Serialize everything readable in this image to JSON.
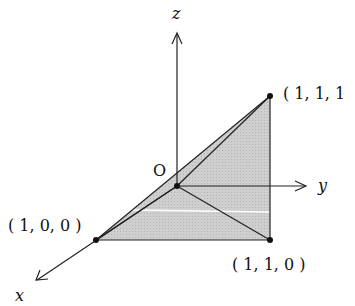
{
  "diagram": {
    "type": "3d-coordinate-triangle",
    "axes": {
      "x_label": "x",
      "y_label": "y",
      "z_label": "z"
    },
    "origin_label": "O",
    "points": [
      {
        "label": "( 1, 1, 1",
        "coords": [
          1,
          1,
          1
        ]
      },
      {
        "label": "( 1, 0, 0 )",
        "coords": [
          1,
          0,
          0
        ]
      },
      {
        "label": "( 1, 1, 0 )",
        "coords": [
          1,
          1,
          0
        ]
      }
    ],
    "colors": {
      "fill": "#c8c8c8",
      "line": "#222222"
    }
  }
}
